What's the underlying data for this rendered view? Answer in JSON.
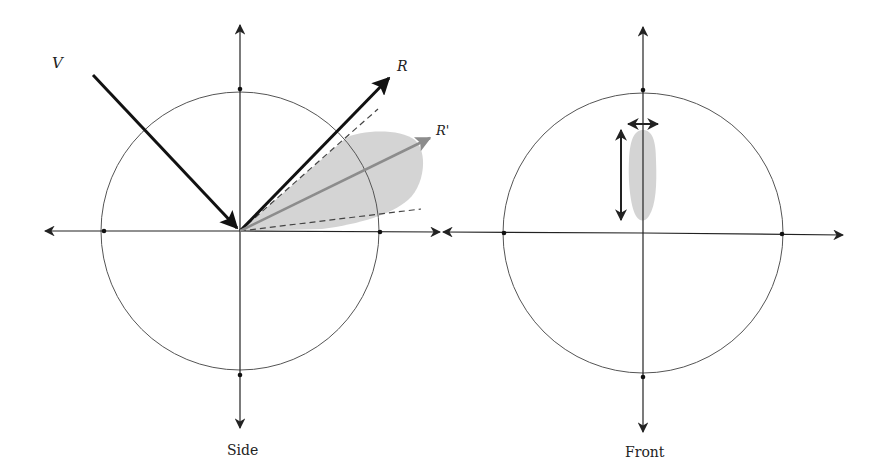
{
  "figure": {
    "panels": [
      {
        "id": "side",
        "caption": "Side",
        "vectors": [
          {
            "label": "V",
            "kind": "incident"
          },
          {
            "label": "R",
            "kind": "mirror-reflection"
          },
          {
            "label": "R'",
            "kind": "off-specular-peak"
          }
        ]
      },
      {
        "id": "front",
        "caption": "Front"
      }
    ],
    "colors": {
      "axis": "#222222",
      "circle": "#555555",
      "lobe": "#d4d4d4",
      "r_prime_arrow": "#8c8c8c",
      "dashed": "#444444"
    }
  }
}
